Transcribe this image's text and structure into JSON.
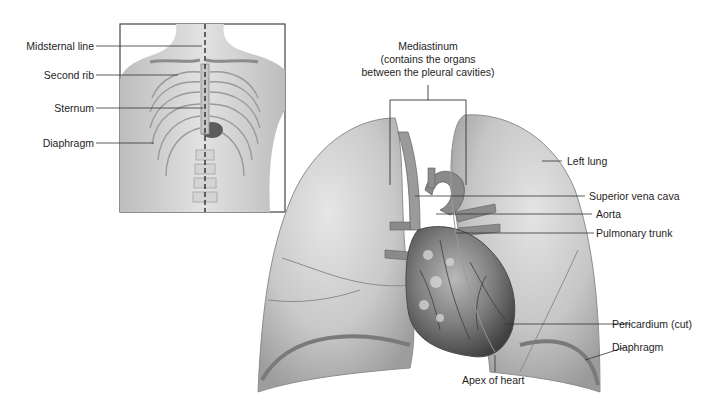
{
  "diagram": {
    "type": "anatomical-illustration",
    "inset": {
      "labels": [
        {
          "id": "midsternal-line",
          "text": "Midsternal line"
        },
        {
          "id": "second-rib",
          "text": "Second rib"
        },
        {
          "id": "sternum",
          "text": "Sternum"
        },
        {
          "id": "diaphragm",
          "text": "Diaphragm"
        }
      ]
    },
    "main": {
      "mediastinum": {
        "title": "Mediastinum",
        "line2": "(contains the organs",
        "line3": "between the pleural cavities)"
      },
      "right_labels": [
        {
          "id": "left-lung",
          "text": "Left lung"
        },
        {
          "id": "superior-vena-cava",
          "text": "Superior vena cava"
        },
        {
          "id": "aorta",
          "text": "Aorta"
        },
        {
          "id": "pulmonary-trunk",
          "text": "Pulmonary trunk"
        },
        {
          "id": "pericardium",
          "text": "Pericardium (cut)"
        },
        {
          "id": "diaphragm-main",
          "text": "Diaphragm"
        }
      ],
      "bottom_label": {
        "id": "apex-of-heart",
        "text": "Apex of heart"
      }
    },
    "colors": {
      "lung": "#cfcfcf",
      "lung_shadow": "#a9a9a9",
      "heart": "#6f6f6f",
      "vessel": "#8a8a8a",
      "leader_line": "#333333",
      "inset_border": "#444444"
    }
  }
}
